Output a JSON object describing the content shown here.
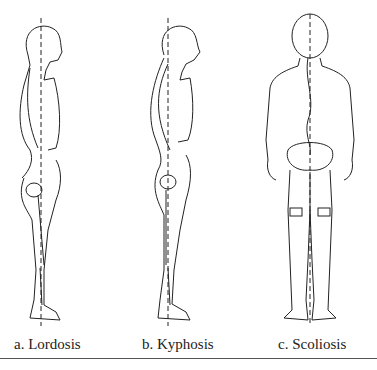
{
  "figure": {
    "panels": [
      {
        "id": "a",
        "caption": "a. Lordosis",
        "view": "lateral",
        "condition": "Lordosis"
      },
      {
        "id": "b",
        "caption": "b. Kyphosis",
        "view": "lateral",
        "condition": "Kyphosis"
      },
      {
        "id": "c",
        "caption": "c. Scoliosis",
        "view": "posterior",
        "condition": "Scoliosis"
      }
    ],
    "line_color": "#222222",
    "background": "#ffffff"
  }
}
